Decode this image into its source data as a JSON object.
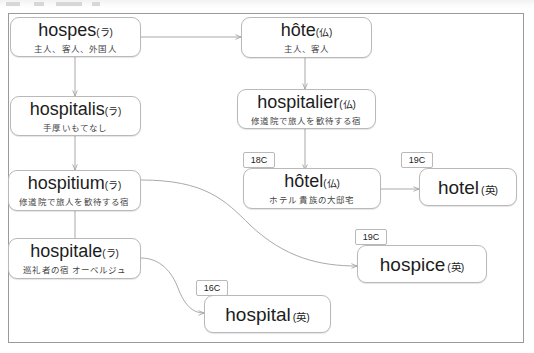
{
  "diagram": {
    "title_visible": false,
    "frame_color": "#9a9a9a",
    "node_border_color": "#b9b9b9",
    "wire_color": "#9f9f9f",
    "nodes": [
      {
        "id": "hospes",
        "term": "hospes",
        "lang": "(ラ)",
        "gloss": "主人、客人、外国人"
      },
      {
        "id": "hospitalis",
        "term": "hospitalis",
        "lang": "(ラ)",
        "gloss": "手厚いもてなし"
      },
      {
        "id": "hospitium",
        "term": "hospitium",
        "lang": "(ラ)",
        "gloss": "修道院で旅人を歓待する宿"
      },
      {
        "id": "hospitale",
        "term": "hospitale",
        "lang": "(ラ)",
        "gloss": "巡礼者の宿 オーベルジュ"
      },
      {
        "id": "hote",
        "term": "hôte",
        "lang": "(仏)",
        "gloss": "主人、客人"
      },
      {
        "id": "hospitalier",
        "term": "hospitalier",
        "lang": "(仏)",
        "gloss": "修道院で旅人を歓待する宿"
      },
      {
        "id": "hotel",
        "term": "hôtel",
        "lang": "(仏)",
        "gloss": "ホテル 貴族の大邸宅"
      },
      {
        "id": "hotel_en",
        "term": "hotel",
        "lang": "(英)",
        "gloss": ""
      },
      {
        "id": "hospice_en",
        "term": "hospice",
        "lang": "(英)",
        "gloss": ""
      },
      {
        "id": "hospital_en",
        "term": "hospital",
        "lang": "(英)",
        "gloss": ""
      }
    ],
    "century_tags": [
      {
        "id": "tag_hotel_fr",
        "label": "18C"
      },
      {
        "id": "tag_hotel_en",
        "label": "19C"
      },
      {
        "id": "tag_hospice_en",
        "label": "19C"
      },
      {
        "id": "tag_hospital_en",
        "label": "16C"
      }
    ],
    "edges": [
      {
        "from": "hospes",
        "to": "hote",
        "style": "straight"
      },
      {
        "from": "hospes",
        "to": "hospitalis",
        "style": "straight"
      },
      {
        "from": "hospitalis",
        "to": "hospitium",
        "style": "straight"
      },
      {
        "from": "hospitium",
        "to": "hospitale",
        "style": "straight"
      },
      {
        "from": "hote",
        "to": "hospitalier",
        "style": "straight"
      },
      {
        "from": "hospitalier",
        "to": "hotel",
        "style": "straight"
      },
      {
        "from": "hotel",
        "to": "hotel_en",
        "style": "straight"
      },
      {
        "from": "hospitium",
        "to": "hospice_en",
        "style": "curved"
      },
      {
        "from": "hospitale",
        "to": "hospital_en",
        "style": "curved"
      }
    ]
  }
}
